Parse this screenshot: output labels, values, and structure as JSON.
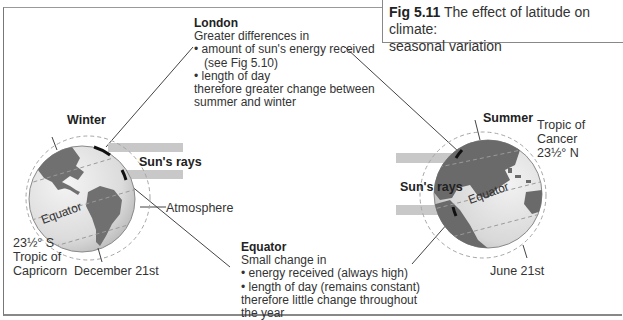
{
  "figure": {
    "number": "Fig 5.11",
    "title": "The effect of latitude on climate:",
    "title_line2": "seasonal variation"
  },
  "london_note": {
    "title": "London",
    "intro": "Greater differences in",
    "bullets": [
      "• amount of sun's energy received",
      "(see Fig 5.10)",
      "• length of day"
    ],
    "conclusion_1": "therefore greater change between",
    "conclusion_2": "summer and winter"
  },
  "equator_note": {
    "title": "Equator",
    "intro": "Small change in",
    "bullets": [
      "• energy received (always high)",
      "• length of day (remains constant)"
    ],
    "conclusion_1": "therefore little change throughout",
    "conclusion_2": "the year"
  },
  "winter_globe": {
    "season": "Winter",
    "sun_rays": "Sun's rays",
    "atmosphere": "Atmosphere",
    "equator": "Equator",
    "tropic_lat": "23½° S",
    "tropic_name_1": "Tropic of",
    "tropic_name_2": "Capricorn",
    "date": "December 21st"
  },
  "summer_globe": {
    "season": "Summer",
    "sun_rays": "Sun's rays",
    "equator": "Equator",
    "tropic_name_1": "Tropic of",
    "tropic_name_2": "Cancer",
    "tropic_lat": "23½° N",
    "date": "June 21st"
  },
  "colors": {
    "land": "#6e6e6e",
    "ocean_light": "#e6e6e6",
    "ocean_dark": "#bdbdbd",
    "ray_bar": "#c8c8c8",
    "atmosphere_dash": "#a0a0a0"
  }
}
